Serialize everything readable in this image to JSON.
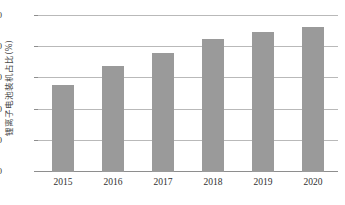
{
  "chart_data": {
    "type": "bar",
    "title": "",
    "subtitle": "",
    "xlabel": "",
    "ylabel": "锂离子电池装机占比(%)",
    "categories": [
      "2015",
      "2016",
      "2017",
      "2018",
      "2019",
      "2020"
    ],
    "values": [
      56,
      68,
      76,
      85,
      90,
      93
    ],
    "series": [
      {
        "name": "锂离子电池装机占比",
        "values": [
          56,
          68,
          76,
          85,
          90,
          93
        ]
      }
    ],
    "ylim": [
      0,
      100
    ],
    "yticks": [
      0,
      20,
      40,
      60,
      80,
      100
    ],
    "ytick_labels": [
      "0",
      "20",
      "40",
      "60",
      "80",
      "100"
    ],
    "xtick_labels": [
      "2015",
      "2016",
      "2017",
      "2018",
      "2019",
      "2020"
    ],
    "grid": true,
    "grid_axis": "y",
    "legend": false,
    "legend_position": "none",
    "bar_color": "#9a9a9a",
    "grid_color": "#b9b9b9",
    "axis_color": "#8e8e8e",
    "background_color": "#ffffff",
    "annotations": []
  },
  "axis": {
    "y_title": "锂离子电池装机占比(%)"
  }
}
